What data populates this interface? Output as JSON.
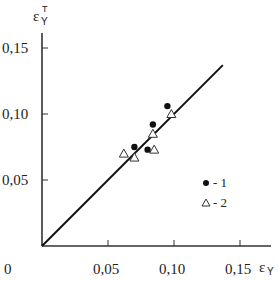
{
  "chart_data": {
    "type": "scatter",
    "title": "",
    "xlabel": "εY",
    "ylabel": "εY^T",
    "xlabel_parts": {
      "main": "ε",
      "sub": "Y"
    },
    "ylabel_parts": {
      "main": "ε",
      "sub": "Y",
      "sup": "T"
    },
    "xlim": [
      0,
      0.16
    ],
    "ylim": [
      0,
      0.16
    ],
    "grid": false,
    "x_ticks": [
      0.05,
      0.1,
      0.15
    ],
    "y_ticks": [
      0.05,
      0.1,
      0.15
    ],
    "x_tick_labels": [
      "0,05",
      "0,10",
      "0,15"
    ],
    "y_tick_labels": [
      "0,05",
      "0,10",
      "0,15"
    ],
    "origin_label": "0",
    "reference_line": {
      "type": "y=x",
      "from": [
        0,
        0
      ],
      "to": [
        0.137,
        0.137
      ]
    },
    "series": [
      {
        "name": "1",
        "marker": "filled-circle",
        "points": [
          [
            0.07,
            0.075
          ],
          [
            0.08,
            0.073
          ],
          [
            0.084,
            0.092
          ],
          [
            0.095,
            0.106
          ]
        ]
      },
      {
        "name": "2",
        "marker": "open-triangle",
        "points": [
          [
            0.062,
            0.07
          ],
          [
            0.07,
            0.067
          ],
          [
            0.085,
            0.073
          ],
          [
            0.084,
            0.085
          ],
          [
            0.098,
            0.1
          ]
        ]
      }
    ],
    "legend": {
      "position": "lower-right",
      "entries": [
        {
          "marker": "filled-circle",
          "label": "- 1"
        },
        {
          "marker": "open-triangle",
          "label": "- 2"
        }
      ]
    }
  }
}
